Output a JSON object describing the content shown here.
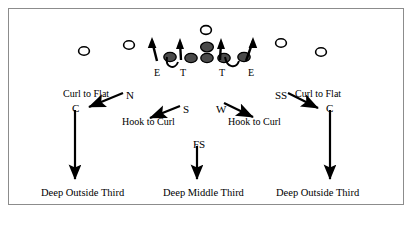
{
  "diagram": {
    "frame_color": "#8c8c8c",
    "ink_color": "#000000"
  },
  "defensive_line": {
    "labels": [
      {
        "text": "E",
        "x": 154,
        "y": 68
      },
      {
        "text": "T",
        "x": 180,
        "y": 68
      },
      {
        "text": "T",
        "x": 219,
        "y": 68
      },
      {
        "text": "E",
        "x": 248,
        "y": 68
      }
    ]
  },
  "linebackers": [
    {
      "name": "nickel",
      "text": "N",
      "x": 126,
      "y": 90
    },
    {
      "name": "sam",
      "text": "S",
      "x": 183,
      "y": 104
    },
    {
      "name": "will",
      "text": "W",
      "x": 216,
      "y": 104
    }
  ],
  "defensive_backs": [
    {
      "name": "corner-left",
      "text": "C",
      "x": 72,
      "y": 103
    },
    {
      "name": "strong-safety",
      "text": "SS",
      "x": 275,
      "y": 90
    },
    {
      "name": "corner-right",
      "text": "C",
      "x": 326,
      "y": 103
    },
    {
      "name": "free-safety",
      "text": "FS",
      "x": 193,
      "y": 139
    }
  ],
  "zone_labels": [
    {
      "name": "curl-to-flat-left",
      "text": "Curl to Flat",
      "x": 63,
      "y": 89
    },
    {
      "name": "hook-to-curl-left",
      "text": "Hook to Curl",
      "x": 122,
      "y": 117
    },
    {
      "name": "hook-to-curl-right",
      "text": "Hook to Curl",
      "x": 228,
      "y": 117
    },
    {
      "name": "curl-to-flat-right",
      "text": "Curl to Flat",
      "x": 295,
      "y": 89
    }
  ],
  "deep_zones": [
    {
      "name": "deep-outside-third-left",
      "text": "Deep Outside Third",
      "x": 41,
      "y": 188
    },
    {
      "name": "deep-middle-third",
      "text": "Deep Middle Third",
      "x": 163,
      "y": 188
    },
    {
      "name": "deep-outside-third-right",
      "text": "Deep Outside Third",
      "x": 276,
      "y": 188
    }
  ]
}
